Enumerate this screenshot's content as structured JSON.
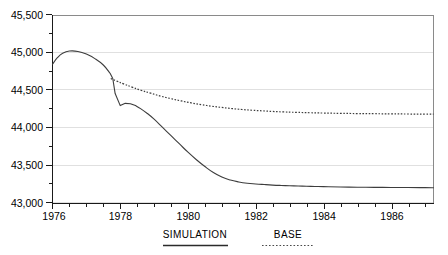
{
  "chart_data": {
    "type": "line",
    "title": "",
    "subtitle": "",
    "xlabel": "",
    "ylabel": "",
    "xlim": [
      1976.0,
      1987.25
    ],
    "ylim": [
      43000,
      45500
    ],
    "grid": true,
    "y_ticks": [
      43000,
      43500,
      44000,
      44500,
      45000,
      45500
    ],
    "y_tick_labels": [
      "43,000",
      "43,500",
      "44,000",
      "44,500",
      "45,000",
      "45,500"
    ],
    "y_minor_tick_step": 250,
    "x_ticks": [
      1976,
      1978,
      1980,
      1982,
      1984,
      1986
    ],
    "x_tick_labels": [
      "1976",
      "1978",
      "1980",
      "1982",
      "1984",
      "1986"
    ],
    "x_minor_tick_step": 0.5,
    "legend_position": "below-axes",
    "series": [
      {
        "name": "SIMULATION",
        "style": "solid",
        "color": "#3d3d3d",
        "x": [
          1976.0,
          1976.15,
          1976.3,
          1976.5,
          1976.75,
          1977.0,
          1977.25,
          1977.5,
          1977.7,
          1977.78,
          1977.85,
          1978.0,
          1978.15,
          1978.3,
          1978.45,
          1978.6,
          1978.8,
          1979.0,
          1979.25,
          1979.5,
          1979.75,
          1980.0,
          1980.25,
          1980.5,
          1980.75,
          1981.0,
          1981.25,
          1981.5,
          1981.75,
          1982.0,
          1982.25,
          1982.5,
          1982.75,
          1983.0,
          1983.25,
          1983.5,
          1983.75,
          1984.0,
          1984.5,
          1985.0,
          1985.5,
          1986.0,
          1986.5,
          1987.0,
          1987.25
        ],
        "y": [
          44840,
          44930,
          44985,
          45015,
          45010,
          44975,
          44915,
          44830,
          44720,
          44650,
          44450,
          44290,
          44320,
          44315,
          44290,
          44250,
          44185,
          44110,
          44000,
          43890,
          43780,
          43670,
          43570,
          43480,
          43400,
          43340,
          43300,
          43275,
          43258,
          43248,
          43240,
          43233,
          43228,
          43224,
          43220,
          43217,
          43214,
          43212,
          43208,
          43205,
          43203,
          43201,
          43200,
          43199,
          43198
        ]
      },
      {
        "name": "BASE",
        "style": "dotted",
        "color": "#3d3d3d",
        "x": [
          1977.72,
          1977.9,
          1978.1,
          1978.35,
          1978.6,
          1978.9,
          1979.2,
          1979.5,
          1979.8,
          1980.1,
          1980.4,
          1980.7,
          1981.0,
          1981.3,
          1981.6,
          1981.9,
          1982.2,
          1982.5,
          1982.8,
          1983.2,
          1983.6,
          1984.0,
          1984.5,
          1985.0,
          1985.5,
          1986.0,
          1986.5,
          1987.0,
          1987.25
        ],
        "y": [
          44650,
          44615,
          44578,
          44535,
          44495,
          44455,
          44415,
          44382,
          44352,
          44325,
          44302,
          44282,
          44265,
          44250,
          44238,
          44228,
          44220,
          44212,
          44206,
          44200,
          44195,
          44191,
          44187,
          44184,
          44182,
          44180,
          44178,
          44177,
          44176
        ]
      }
    ],
    "annotations": [
      {
        "text": "sharp drop in SIMULATION at policy shock, late 1977",
        "x": 1977.85,
        "y": 44290
      }
    ]
  },
  "legend": {
    "entries": [
      {
        "label": "SIMULATION",
        "style": "solid"
      },
      {
        "label": "BASE",
        "style": "dotted"
      }
    ]
  }
}
